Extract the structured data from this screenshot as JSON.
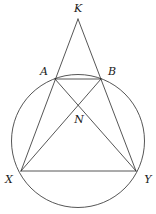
{
  "figure": {
    "type": "geometry-diagram",
    "width": 156,
    "height": 214,
    "background_color": "#ffffff",
    "stroke_color": "#2b2b2b",
    "stroke_width": 0.8,
    "label_color": "#1a1a1a"
  },
  "points": [
    {
      "id": "K",
      "label": "K",
      "x": 78,
      "y": 19,
      "label_x": 78,
      "label_y": 8,
      "on_circle": false
    },
    {
      "id": "A",
      "label": "A",
      "x": 55,
      "y": 79,
      "label_x": 44,
      "label_y": 71,
      "on_circle": true
    },
    {
      "id": "B",
      "label": "B",
      "x": 101,
      "y": 79,
      "label_x": 112,
      "label_y": 71,
      "on_circle": true
    },
    {
      "id": "N",
      "label": "N",
      "x": 78,
      "y": 107,
      "label_x": 79,
      "label_y": 119,
      "on_circle": false
    },
    {
      "id": "X",
      "label": "X",
      "x": 21,
      "y": 171,
      "label_x": 9,
      "label_y": 179,
      "on_circle": true
    },
    {
      "id": "Y",
      "label": "Y",
      "x": 136,
      "y": 171,
      "label_x": 148,
      "label_y": 179,
      "on_circle": true
    }
  ],
  "circle": {
    "center_x": 78,
    "center_y": 141,
    "radius": 66.5
  },
  "segments": [
    {
      "id": "KX",
      "from": "K",
      "to": "X",
      "note": "line from apex K through A to X"
    },
    {
      "id": "KY",
      "from": "K",
      "to": "Y",
      "note": "line from apex K through B to Y"
    },
    {
      "id": "AB",
      "from": "A",
      "to": "B",
      "note": "chord AB"
    },
    {
      "id": "XY",
      "from": "X",
      "to": "Y",
      "note": "chord XY"
    },
    {
      "id": "AY",
      "from": "A",
      "to": "Y",
      "note": "diagonal A to Y through N"
    },
    {
      "id": "BX",
      "from": "B",
      "to": "X",
      "note": "diagonal B to X through N"
    }
  ]
}
